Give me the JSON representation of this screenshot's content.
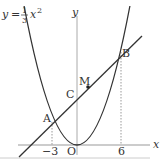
{
  "diagram": {
    "equation": {
      "y": "y",
      "eq": "=",
      "num": "1",
      "den": "3",
      "x": "x",
      "exp": "2"
    },
    "axes": {
      "x_label": "x",
      "y_label": "y",
      "origin_label": "O"
    },
    "ticks": {
      "neg3": "−3",
      "six": "6"
    },
    "points": {
      "A": "A",
      "B": "B",
      "C": "C",
      "M": "M"
    },
    "colors": {
      "line": "#333333",
      "axis": "#888888",
      "dotted": "#aaaaaa"
    }
  }
}
